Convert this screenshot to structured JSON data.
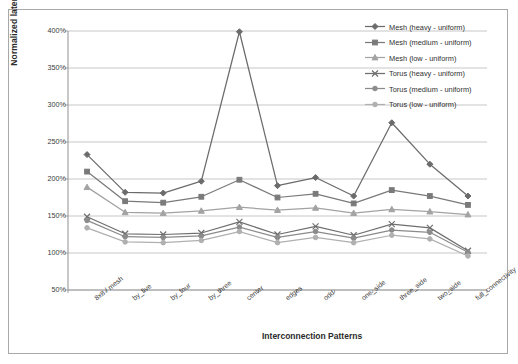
{
  "chart_data": {
    "type": "line",
    "title": "",
    "xlabel": "Interconnection Patterns",
    "ylabel": "Normalized latency",
    "ylim": [
      50,
      400
    ],
    "ytick_step": 50,
    "ytick_labels": [
      "400%",
      "350%",
      "300%",
      "250%",
      "200%",
      "150%",
      "100%",
      "50%"
    ],
    "ytick_values": [
      400,
      350,
      300,
      250,
      200,
      150,
      100,
      50
    ],
    "grid": "horizontal",
    "legend_position": "top-right",
    "categories": [
      "8x8 / mesh",
      "by_five",
      "by_four",
      "by_three",
      "center",
      "edges",
      "odd",
      "one_side",
      "three_side",
      "two_side",
      "full_connectivity"
    ],
    "series": [
      {
        "name": "Mesh  (heavy - uniform)",
        "marker": "diamond",
        "color": "#6b6b6b",
        "values": [
          233,
          182,
          181,
          197,
          399,
          191,
          202,
          177,
          276,
          220,
          177
        ]
      },
      {
        "name": "Mesh  (medium - uniform)",
        "marker": "square",
        "color": "#7a7a7a",
        "values": [
          210,
          170,
          168,
          176,
          199,
          175,
          180,
          167,
          185,
          177,
          165
        ]
      },
      {
        "name": "Mesh  (low - uniform)",
        "marker": "triangle",
        "color": "#a3a3a3",
        "values": [
          189,
          155,
          154,
          157,
          162,
          158,
          161,
          154,
          159,
          156,
          152
        ]
      },
      {
        "name": "Torus  (heavy - uniform)",
        "marker": "cross",
        "color": "#6f6f6f",
        "values": [
          149,
          126,
          125,
          127,
          142,
          125,
          136,
          124,
          139,
          134,
          103
        ]
      },
      {
        "name": "Torus  (medium - uniform)",
        "marker": "circle",
        "color": "#8b8b8b",
        "values": [
          144,
          122,
          121,
          123,
          135,
          121,
          129,
          120,
          131,
          128,
          101
        ]
      },
      {
        "name": "Torus  (low - uniform)",
        "marker": "circle",
        "color": "#b0b0b0",
        "values": [
          134,
          115,
          114,
          117,
          129,
          114,
          121,
          114,
          124,
          119,
          96
        ]
      }
    ]
  },
  "axes": {
    "ylabel": "Normalized latency",
    "xlabel": "Interconnection Patterns"
  },
  "legend": {
    "items": [
      "Mesh  (heavy - uniform)",
      "Mesh  (medium - uniform)",
      "Mesh  (low - uniform)",
      "Torus  (heavy - uniform)",
      "Torus  (medium - uniform)",
      "Torus  (low - uniform)"
    ]
  }
}
